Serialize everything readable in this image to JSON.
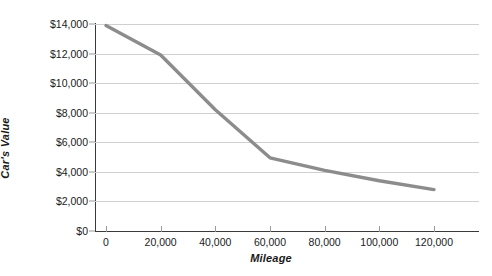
{
  "chart_data": {
    "type": "line",
    "title": "",
    "xlabel": "Mileage",
    "ylabel": "Car's Value",
    "x": [
      0,
      20000,
      40000,
      60000,
      80000,
      100000,
      120000
    ],
    "values": [
      13900,
      11900,
      8200,
      4950,
      4100,
      3400,
      2800
    ],
    "series": [
      {
        "name": "Car's Value",
        "values": [
          13900,
          11900,
          8200,
          4950,
          4100,
          3400,
          2800
        ],
        "color": "#8c8c8c"
      }
    ],
    "xlim": [
      0,
      130000
    ],
    "ylim": [
      0,
      14000
    ],
    "xticks": [
      0,
      20000,
      40000,
      60000,
      80000,
      100000,
      120000
    ],
    "xticklabels": [
      "0",
      "20,000",
      "40,000",
      "60,000",
      "80,000",
      "100,000",
      "120,000"
    ],
    "yticks": [
      0,
      2000,
      4000,
      6000,
      8000,
      10000,
      12000,
      14000
    ],
    "yticklabels": [
      "$0",
      "$2,000",
      "$4,000",
      "$6,000",
      "$8,000",
      "$10,000",
      "$12,000",
      "$14,000"
    ],
    "grid": "horizontal",
    "legend": "none",
    "line_color": "#8c8c8c",
    "grid_color": "#d0d0d0",
    "axis_color": "#3a3a3a",
    "text_color": "#1a1a1a",
    "background": "#ffffff"
  }
}
